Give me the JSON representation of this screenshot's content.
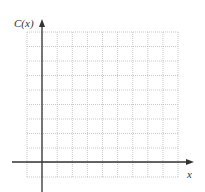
{
  "graph": {
    "y_axis_label": "C(x)",
    "x_axis_label": "x",
    "grid": {
      "left": 27,
      "right": 178,
      "top": 32,
      "bottom": 177,
      "columns": 10,
      "rows": 10,
      "line_color": "#bbbbbb",
      "style": "dotted"
    },
    "axes": {
      "color": "#333333",
      "origin_x": 42,
      "origin_y": 162
    }
  }
}
